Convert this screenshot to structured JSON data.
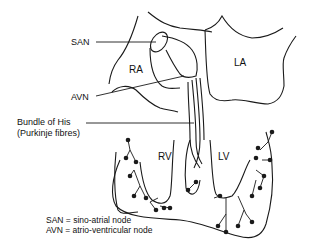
{
  "diagram": {
    "labels": {
      "san": "SAN",
      "avn": "AVN",
      "ra": "RA",
      "la": "LA",
      "rv": "RV",
      "lv": "LV",
      "bundle_of_his": "Bundle of His",
      "purkinje": "(Purkinje fibres)"
    },
    "legend": [
      "SAN = sino-atrial node",
      "AVN = atrio-ventricular node"
    ],
    "colors": {
      "line": "#1a1a1a",
      "background": "#ffffff"
    }
  }
}
